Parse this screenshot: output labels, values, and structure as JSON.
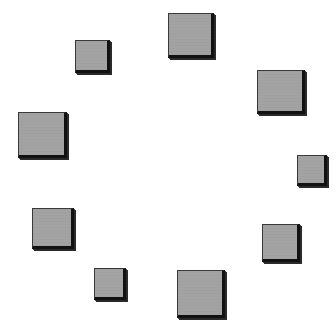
{
  "canvas": {
    "width": 336,
    "height": 323,
    "background": "#ffffff"
  },
  "style": {
    "fill_color": "#a3a3a3",
    "edge_color": "#111111",
    "shadow": "drop shadow to bottom-right"
  },
  "squares": [
    {
      "id": "top-center",
      "x": 168,
      "y": 13,
      "w": 46,
      "h": 45
    },
    {
      "id": "top-left",
      "x": 75,
      "y": 40,
      "w": 35,
      "h": 33
    },
    {
      "id": "top-right",
      "x": 257,
      "y": 70,
      "w": 48,
      "h": 44
    },
    {
      "id": "left",
      "x": 18,
      "y": 112,
      "w": 49,
      "h": 46
    },
    {
      "id": "right",
      "x": 297,
      "y": 155,
      "w": 30,
      "h": 31
    },
    {
      "id": "bottom-left",
      "x": 32,
      "y": 208,
      "w": 42,
      "h": 41
    },
    {
      "id": "bottom-right",
      "x": 262,
      "y": 224,
      "w": 38,
      "h": 38
    },
    {
      "id": "bottom-left-small",
      "x": 94,
      "y": 268,
      "w": 32,
      "h": 32
    },
    {
      "id": "bottom-center",
      "x": 177,
      "y": 270,
      "w": 48,
      "h": 48
    }
  ]
}
